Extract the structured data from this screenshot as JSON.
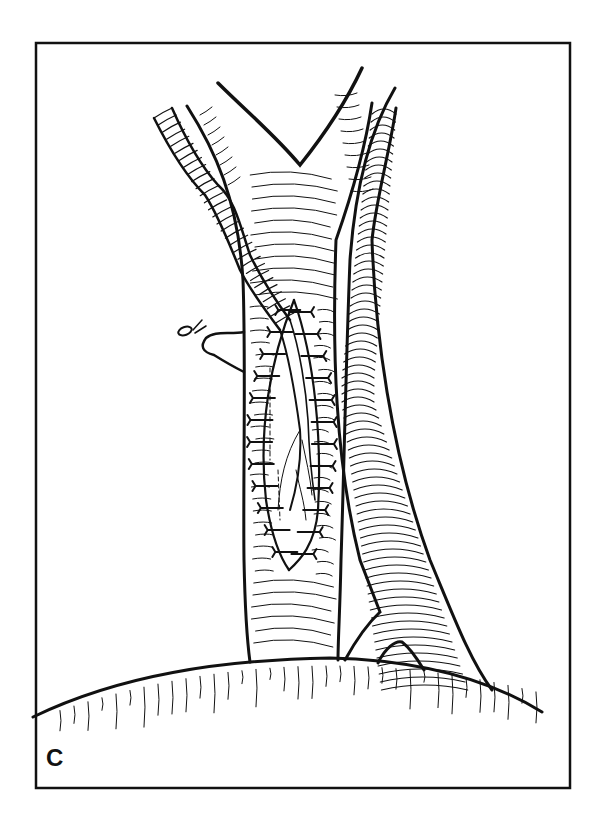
{
  "figure": {
    "panel_label": "C",
    "ink_color": "#111111",
    "background_color": "#ffffff"
  }
}
